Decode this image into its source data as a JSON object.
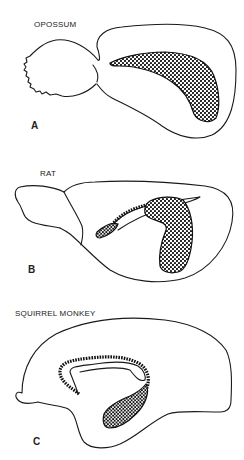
{
  "figure": {
    "panels": [
      {
        "letter": "A",
        "species": "OPOSSUM"
      },
      {
        "letter": "B",
        "species": "RAT"
      },
      {
        "letter": "C",
        "species": "SQUIRREL MONKEY"
      }
    ],
    "colors": {
      "stroke": "#1a1a1a",
      "stipple": "#111111",
      "background": "#ffffff"
    }
  }
}
